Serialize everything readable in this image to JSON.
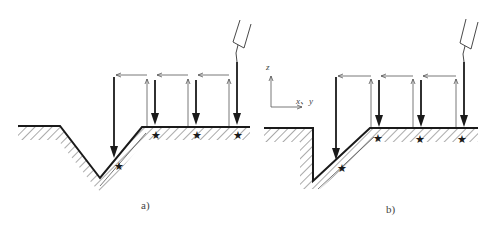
{
  "figure": {
    "subfigures": [
      {
        "id": "a",
        "caption": "a)",
        "profile": "V-groove"
      },
      {
        "id": "b",
        "caption": "b)",
        "profile": "step with inclined wall"
      }
    ],
    "axis": {
      "vertical_label": "z",
      "horizontal_label": "x、y"
    },
    "colors": {
      "line": "#1a1a1a",
      "thin_line": "#555555",
      "hatch": "#555555",
      "background": "#ffffff"
    },
    "legend": {
      "thick_down_arrow": "probe approach / touch move",
      "thin_up_arrow": "retract",
      "thin_left_arrow": "reposition",
      "star": "touch point"
    }
  }
}
